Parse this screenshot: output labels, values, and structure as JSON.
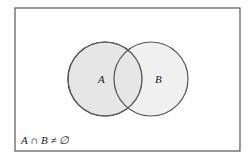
{
  "diagram": {
    "type": "venn",
    "universe": {
      "x": 15,
      "y": 8,
      "width": 225,
      "height": 143,
      "stroke": "#555555"
    },
    "sets": [
      {
        "label": "A",
        "cx": 105,
        "cy": 79,
        "r": 37,
        "fill": "#e6e6e6",
        "stroke": "#555555"
      },
      {
        "label": "B",
        "cx": 151,
        "cy": 79,
        "r": 37,
        "fill": "#e6e6e6",
        "stroke": "#555555"
      }
    ],
    "caption": "A ∩ B ≠ ∅"
  }
}
